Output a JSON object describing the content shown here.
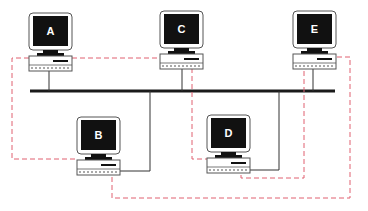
{
  "diagram": {
    "type": "network-topology",
    "colors": {
      "bus": "#1a1a1a",
      "solid_link": "#333333",
      "dashed_link": "#e06070",
      "screen": "#111111",
      "label": "#ffffff"
    },
    "nodes": [
      {
        "id": "A",
        "label": "A"
      },
      {
        "id": "B",
        "label": "B"
      },
      {
        "id": "C",
        "label": "C"
      },
      {
        "id": "D",
        "label": "D"
      },
      {
        "id": "E",
        "label": "E"
      }
    ],
    "bus_links": [
      "A",
      "B",
      "C",
      "D",
      "E"
    ],
    "ring_links": [
      [
        "A",
        "B"
      ],
      [
        "A",
        "C"
      ],
      [
        "C",
        "D"
      ],
      [
        "D",
        "E"
      ],
      [
        "E",
        "B"
      ]
    ]
  }
}
